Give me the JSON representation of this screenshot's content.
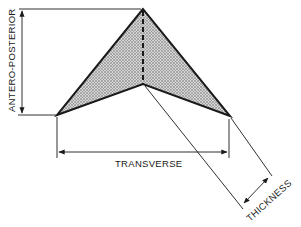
{
  "figure": {
    "type": "dimension-diagram",
    "shape": "arrowhead / chevron shaped object with shaded surface",
    "labels": {
      "vertical": "ANTERO-POSTERIOR",
      "horizontal": "TRANSVERSE",
      "diagonal": "THICKNESS"
    },
    "colors": {
      "outline": "#1a1a1a",
      "fill": "#c9c9c9",
      "background": "#ffffff"
    }
  }
}
